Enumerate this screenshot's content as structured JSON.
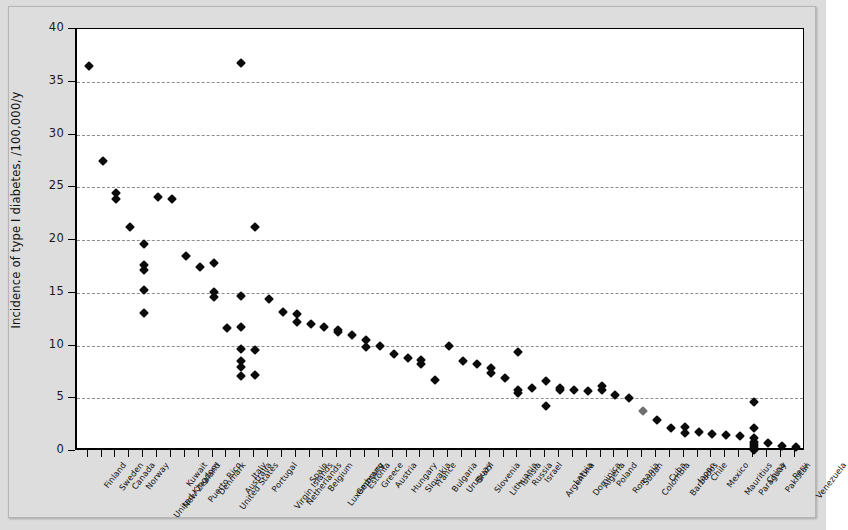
{
  "chart_data": {
    "type": "scatter",
    "title": "",
    "xlabel": "",
    "ylabel": "Incidence of type I diabetes, /100,000/y",
    "ylim": [
      0,
      40
    ],
    "yticks": [
      0,
      5,
      10,
      15,
      20,
      25,
      30,
      35,
      40
    ],
    "ytick_labels": [
      "0",
      "5",
      "10",
      "15",
      "20",
      "25",
      "30",
      "35",
      "40"
    ],
    "grid": true,
    "grid_style": "dashed horizontal",
    "legend": "none",
    "marker": "filled diamond",
    "marker_color": "#0b0b0b",
    "categories": [
      "Finland",
      "Sweden",
      "Canada",
      "Norway",
      "United Kingdom",
      "New Zealand",
      "Kuwait",
      "Puerto Rico",
      "Denmark",
      "United States",
      "Australia",
      "Italy",
      "Portugal",
      "Virgin Islands",
      "Netherlands",
      "Spain",
      "Belgium",
      "Luxembourg",
      "Germany",
      "Estonia",
      "Greece",
      "Austria",
      "Hungary",
      "Slovakia",
      "France",
      "Bulgaria",
      "Uruguay",
      "Brazil",
      "Slovenia",
      "Lithuania",
      "Tunisia",
      "Russia",
      "Israel",
      "Argentina",
      "Latvia",
      "Dominica",
      "Algeria",
      "Poland",
      "Romania",
      "Sudan",
      "Colombia",
      "Cuba",
      "Barbados",
      "Japan",
      "Chile",
      "Mexico",
      "Mauritius",
      "Paraguay",
      "China",
      "Pakistan",
      "Peru",
      "Venezuela"
    ],
    "points": [
      {
        "category": "Finland",
        "values": [
          36.5
        ]
      },
      {
        "category": "Sweden",
        "values": [
          27.5
        ]
      },
      {
        "category": "Canada",
        "values": [
          24.5,
          23.9
        ]
      },
      {
        "category": "Norway",
        "values": [
          21.2
        ]
      },
      {
        "category": "United Kingdom",
        "values": [
          19.6,
          17.6,
          17.2,
          15.3,
          13.1
        ]
      },
      {
        "category": "New Zealand",
        "values": [
          24.1
        ]
      },
      {
        "category": "Kuwait",
        "values": [
          23.9
        ]
      },
      {
        "category": "Puerto Rico",
        "values": [
          18.5
        ]
      },
      {
        "category": "Denmark",
        "values": [
          17.4
        ]
      },
      {
        "category": "United States",
        "values": [
          17.8,
          15.1,
          14.6
        ]
      },
      {
        "category": "Australia",
        "values": [
          11.7
        ]
      },
      {
        "category": "Italy",
        "values": [
          36.8,
          14.7,
          11.8,
          9.7,
          8.5,
          8.0,
          7.1
        ]
      },
      {
        "category": "Portugal",
        "values": [
          21.2,
          9.6,
          7.2
        ]
      },
      {
        "category": "Virgin Islands",
        "values": [
          14.4
        ]
      },
      {
        "category": "Netherlands",
        "values": [
          13.2
        ]
      },
      {
        "category": "Spain",
        "values": [
          13.0,
          12.2
        ]
      },
      {
        "category": "Belgium",
        "values": [
          12.0
        ]
      },
      {
        "category": "Luxembourg",
        "values": [
          11.8
        ]
      },
      {
        "category": "Germany",
        "values": [
          11.5,
          11.3
        ]
      },
      {
        "category": "Estonia",
        "values": [
          11.0
        ]
      },
      {
        "category": "Greece",
        "values": [
          10.5,
          9.9
        ]
      },
      {
        "category": "Austria",
        "values": [
          10.0
        ]
      },
      {
        "category": "Hungary",
        "values": [
          9.2
        ]
      },
      {
        "category": "Slovakia",
        "values": [
          8.8
        ]
      },
      {
        "category": "France",
        "values": [
          8.6,
          8.2
        ]
      },
      {
        "category": "Bulgaria",
        "values": [
          6.7
        ]
      },
      {
        "category": "Uruguay",
        "values": [
          10.0
        ]
      },
      {
        "category": "Brazil",
        "values": [
          8.5
        ]
      },
      {
        "category": "Slovenia",
        "values": [
          8.2
        ]
      },
      {
        "category": "Lithuania",
        "values": [
          7.9,
          7.4
        ]
      },
      {
        "category": "Tunisia",
        "values": [
          6.9
        ]
      },
      {
        "category": "Russia",
        "values": [
          9.4,
          5.8,
          5.5
        ]
      },
      {
        "category": "Israel",
        "values": [
          6.0
        ]
      },
      {
        "category": "Argentina",
        "values": [
          6.6,
          4.3
        ]
      },
      {
        "category": "Latvia",
        "values": [
          6.0,
          5.8
        ]
      },
      {
        "category": "Dominica",
        "values": [
          5.8
        ]
      },
      {
        "category": "Algeria",
        "values": [
          5.7
        ]
      },
      {
        "category": "Poland",
        "values": [
          6.2,
          5.8
        ]
      },
      {
        "category": "Romania",
        "values": [
          5.3
        ]
      },
      {
        "category": "Sudan",
        "values": [
          5.0
        ]
      },
      {
        "category": "Colombia",
        "values": [
          3.8
        ]
      },
      {
        "category": "Cuba",
        "values": [
          2.9
        ]
      },
      {
        "category": "Barbados",
        "values": [
          2.2
        ]
      },
      {
        "category": "Japan",
        "values": [
          2.3,
          1.7
        ]
      },
      {
        "category": "Chile",
        "values": [
          1.8
        ]
      },
      {
        "category": "Mexico",
        "values": [
          1.6
        ]
      },
      {
        "category": "Mauritius",
        "values": [
          1.5
        ]
      },
      {
        "category": "Paraguay",
        "values": [
          1.4
        ]
      },
      {
        "category": "China",
        "values": [
          4.6,
          2.2,
          1.2,
          0.9,
          0.7,
          0.5,
          0.3,
          0.1
        ]
      },
      {
        "category": "Pakistan",
        "values": [
          0.8
        ]
      },
      {
        "category": "Peru",
        "values": [
          0.5
        ]
      },
      {
        "category": "Venezuela",
        "values": [
          0.4
        ]
      }
    ],
    "faint_points": [
      {
        "category": "Colombia",
        "value": 3.8
      }
    ]
  }
}
